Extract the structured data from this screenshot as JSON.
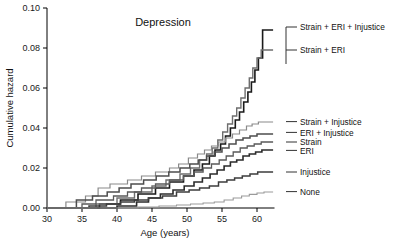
{
  "chart_data": {
    "type": "line",
    "title": "Depression",
    "xlabel": "Age (years)",
    "ylabel": "Cumulative hazard",
    "xlim": [
      30,
      62.5
    ],
    "ylim": [
      0.0,
      0.1
    ],
    "xticks": [
      30,
      35,
      40,
      45,
      50,
      55,
      60
    ],
    "xticklabels": [
      "30",
      "35",
      "40",
      "45",
      "50",
      "55",
      "60"
    ],
    "yticks": [
      0.0,
      0.02,
      0.04,
      0.06,
      0.08,
      0.1
    ],
    "yticklabels": [
      "0.00",
      "0.02",
      "0.04",
      "0.06",
      "0.08",
      "0.10"
    ],
    "grid": false,
    "legend_position": "right-inline-labels",
    "step_shape": "post",
    "series": [
      {
        "name": "Strain + ERI + Injustice",
        "label": "Strain + ERI + Injustice",
        "color": "#1a1a1a",
        "width": 1.6,
        "label_y": 0.0905,
        "x": [
          30,
          37.5,
          40.5,
          43.0,
          45.5,
          47.5,
          49.5,
          51.0,
          52.2,
          53.2,
          54.0,
          54.8,
          55.5,
          56.2,
          56.9,
          57.5,
          58.1,
          58.7,
          59.2,
          59.7,
          60.2,
          60.8,
          62.3
        ],
        "y": [
          0,
          0.002,
          0.004,
          0.007,
          0.01,
          0.013,
          0.016,
          0.019,
          0.022,
          0.026,
          0.029,
          0.032,
          0.036,
          0.04,
          0.044,
          0.048,
          0.053,
          0.058,
          0.063,
          0.069,
          0.075,
          0.089,
          0.089
        ]
      },
      {
        "name": "Strain + ERI",
        "label": "Strain + ERI",
        "color": "#6e6e6e",
        "width": 1.4,
        "label_y": 0.079,
        "x": [
          30,
          37.0,
          40.0,
          42.5,
          45.0,
          47.0,
          49.0,
          50.5,
          51.8,
          52.8,
          53.6,
          54.4,
          55.1,
          55.8,
          56.5,
          57.1,
          57.7,
          58.3,
          58.9,
          59.4,
          60.0,
          60.6,
          62.3
        ],
        "y": [
          0,
          0.002,
          0.005,
          0.008,
          0.011,
          0.014,
          0.017,
          0.02,
          0.024,
          0.027,
          0.03,
          0.034,
          0.038,
          0.042,
          0.046,
          0.05,
          0.055,
          0.06,
          0.065,
          0.07,
          0.075,
          0.079,
          0.079
        ]
      },
      {
        "name": "Strain + Injustice",
        "label": "Strain + Injustice",
        "color": "#8a8a8a",
        "width": 1.2,
        "label_y": 0.0432,
        "x": [
          30,
          32.7,
          35.5,
          37.3,
          39.0,
          41.5,
          43.5,
          45.5,
          47.5,
          48.8,
          50.2,
          51.5,
          52.5,
          53.5,
          54.5,
          55.5,
          56.5,
          57.5,
          58.5,
          59.3,
          60.2,
          62.3
        ],
        "y": [
          0,
          0.003,
          0.006,
          0.01,
          0.012,
          0.014,
          0.016,
          0.018,
          0.02,
          0.022,
          0.025,
          0.027,
          0.029,
          0.031,
          0.033,
          0.035,
          0.037,
          0.039,
          0.041,
          0.042,
          0.043,
          0.043
        ]
      },
      {
        "name": "ERI + Injustice",
        "label": "ERI + Injustice",
        "color": "#4d4d4d",
        "width": 1.5,
        "label_y": 0.0378,
        "x": [
          30,
          34.2,
          36.5,
          38.6,
          40.3,
          42.0,
          43.8,
          45.6,
          47.4,
          49.0,
          50.4,
          51.6,
          52.8,
          53.9,
          55.0,
          56.0,
          57.0,
          58.0,
          59.0,
          60.0,
          62.3
        ],
        "y": [
          0,
          0.004,
          0.006,
          0.008,
          0.01,
          0.012,
          0.014,
          0.016,
          0.018,
          0.02,
          0.022,
          0.024,
          0.026,
          0.028,
          0.03,
          0.032,
          0.034,
          0.035,
          0.036,
          0.037,
          0.037
        ]
      },
      {
        "name": "Strain",
        "label": "Strain",
        "color": "#5a5a5a",
        "width": 1.3,
        "label_y": 0.033,
        "x": [
          30,
          35.0,
          37.0,
          39.5,
          41.5,
          43.5,
          45.5,
          47.5,
          49.5,
          51.0,
          52.3,
          53.5,
          54.6,
          55.6,
          56.6,
          57.6,
          58.6,
          59.6,
          60.6,
          62.3
        ],
        "y": [
          0,
          0.002,
          0.004,
          0.006,
          0.008,
          0.01,
          0.012,
          0.014,
          0.016,
          0.018,
          0.02,
          0.022,
          0.024,
          0.026,
          0.028,
          0.03,
          0.031,
          0.032,
          0.033,
          0.033
        ]
      },
      {
        "name": "ERI",
        "label": "ERI",
        "color": "#2b2b2b",
        "width": 1.6,
        "label_y": 0.0288,
        "x": [
          30,
          40.0,
          42.8,
          44.5,
          46.2,
          48.0,
          49.6,
          51.0,
          52.2,
          53.3,
          54.3,
          55.3,
          56.2,
          57.1,
          58.0,
          58.9,
          59.8,
          60.7,
          62.3
        ],
        "y": [
          0,
          0.001,
          0.003,
          0.005,
          0.007,
          0.009,
          0.011,
          0.013,
          0.015,
          0.017,
          0.019,
          0.021,
          0.023,
          0.024,
          0.026,
          0.027,
          0.028,
          0.029,
          0.029
        ]
      },
      {
        "name": "Injustice",
        "label": "Injustice",
        "color": "#3d3d3d",
        "width": 1.5,
        "label_y": 0.018,
        "x": [
          30,
          36.0,
          38.5,
          40.5,
          42.5,
          44.5,
          46.5,
          48.5,
          50.3,
          51.8,
          53.2,
          54.5,
          55.7,
          56.8,
          57.9,
          59.0,
          60.1,
          62.3
        ],
        "y": [
          0,
          0.001,
          0.002,
          0.003,
          0.004,
          0.005,
          0.006,
          0.008,
          0.009,
          0.01,
          0.011,
          0.013,
          0.014,
          0.015,
          0.016,
          0.017,
          0.018,
          0.018
        ]
      },
      {
        "name": "None",
        "label": "None",
        "color": "#9a9a9a",
        "width": 1.1,
        "label_y": 0.0082,
        "x": [
          30,
          43.0,
          46.0,
          48.5,
          50.5,
          52.3,
          53.9,
          55.3,
          56.6,
          57.8,
          58.9,
          60.0,
          61.0,
          62.3
        ],
        "y": [
          0,
          0.0005,
          0.001,
          0.0015,
          0.002,
          0.0025,
          0.003,
          0.004,
          0.005,
          0.006,
          0.0068,
          0.0075,
          0.008,
          0.008
        ]
      }
    ],
    "legend_entries": [
      "Strain + ERI + Injustice",
      "Strain + ERI",
      "Strain + Injustice",
      "ERI + Injustice",
      "Strain",
      "ERI",
      "Injustice",
      "None"
    ]
  }
}
